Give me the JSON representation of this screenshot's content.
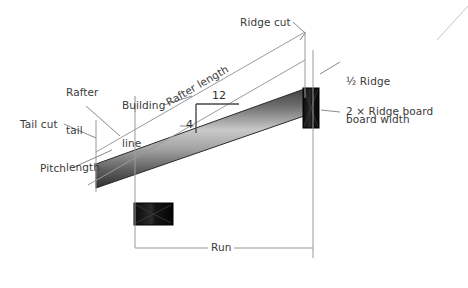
{
  "diagram": {
    "background_color": "#ffffff",
    "line_color": "#8a8a8a",
    "dark_line_color": "#555555",
    "text_color": "#3a3a3a",
    "board_fill_dark": "#111111",
    "rafter_gradient": [
      "#4a4a4a",
      "#d8d8d8",
      "#3c3c3c"
    ]
  },
  "labels": {
    "ridge_cut": "Ridge cut",
    "rafter_tail_length_line1": "Rafter",
    "rafter_tail_length_line2": "tail",
    "rafter_tail_length_line3": "length",
    "building_line_line1": "Building",
    "building_line_line2": "line",
    "rafter_length": "Rafter length",
    "tail_cut": "Tail cut",
    "pitch": "Pitch",
    "run": "Run",
    "half_ridge_board_width_line1": "½ Ridge",
    "half_ridge_board_width_line2": "board width",
    "two_by_ridge_board": "2 × Ridge board"
  },
  "pitch_triangle": {
    "rise": "4",
    "run": "12",
    "description": "Slope indicator: 4 units of rise per 12 units of run"
  },
  "measurements": {
    "run_span_label": "Run",
    "rafter_length_label": "Rafter length",
    "rafter_tail_label": "Rafter tail length"
  }
}
